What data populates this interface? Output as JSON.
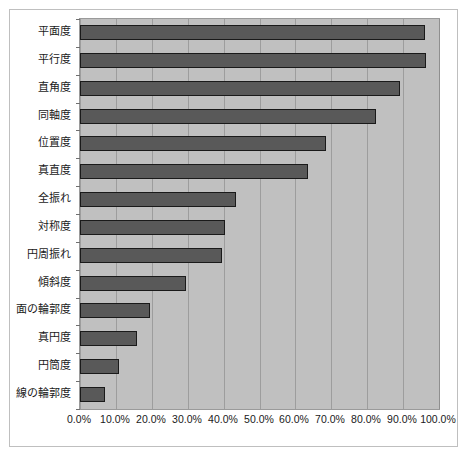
{
  "chart_data": {
    "type": "bar",
    "orientation": "horizontal",
    "title": "",
    "xlabel": "",
    "ylabel": "",
    "categories": [
      "平面度",
      "平行度",
      "直角度",
      "同軸度",
      "位置度",
      "真直度",
      "全振れ",
      "対称度",
      "円周振れ",
      "傾斜度",
      "面の輪郭度",
      "真円度",
      "円筒度",
      "線の輪郭度"
    ],
    "values": [
      96.0,
      96.5,
      89.0,
      82.5,
      68.5,
      63.5,
      43.5,
      40.5,
      39.5,
      29.5,
      19.5,
      16.0,
      11.0,
      7.0
    ],
    "value_unit": "%",
    "xlim": [
      0,
      100
    ],
    "xticks": [
      0,
      10,
      20,
      30,
      40,
      50,
      60,
      70,
      80,
      90,
      100
    ],
    "xtick_labels": [
      "0.0%",
      "10.0%",
      "20.0%",
      "30.0%",
      "40.0%",
      "50.0%",
      "60.0%",
      "70.0%",
      "80.0%",
      "90.0%",
      "100.0%"
    ],
    "grid": "vertical",
    "legend": null,
    "colors": {
      "bar_fill": "#595959",
      "bar_border": "#1a1a1a",
      "plot_background": "#c0c0c0",
      "gridline": "#9d9d9d",
      "frame_border": "#bfbfbf",
      "page_background": "#ffffff",
      "text": "#1a1a1a"
    }
  }
}
